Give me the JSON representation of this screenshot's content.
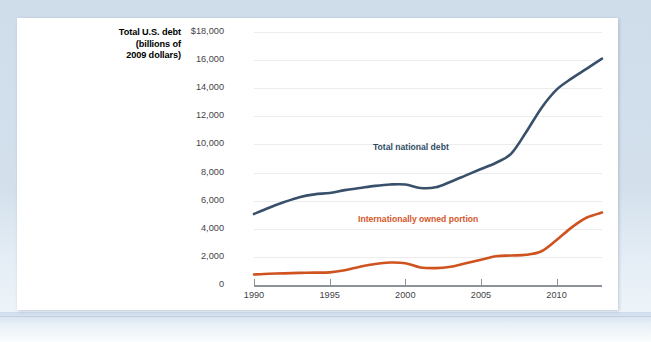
{
  "figure": {
    "axis_title_lines": [
      "Total U.S. debt",
      "(billions of",
      "2009 dollars)"
    ],
    "colors": {
      "total_debt_line": "#39506a",
      "internationally_owned_line": "#cf531f",
      "gridline": "#ececef",
      "axis": "#8d9299",
      "card_background": "#ffffff",
      "page_background": "#d3e0ec"
    }
  },
  "chart_data": {
    "type": "line",
    "title": "",
    "xlabel": "",
    "ylabel": "Total U.S. debt (billions of 2009 dollars)",
    "xlim": [
      1990,
      2013
    ],
    "ylim": [
      0,
      18000
    ],
    "grid": true,
    "legend_position": "inline-annotations",
    "x_tick_labels": [
      "1990",
      "1995",
      "2000",
      "2005",
      "2010"
    ],
    "x_ticks": [
      1990,
      1995,
      2000,
      2005,
      2010
    ],
    "y_tick_labels": [
      "$18,000",
      "16,000",
      "14,000",
      "12,000",
      "10,000",
      "8,000",
      "6,000",
      "4,000",
      "2,000",
      "0"
    ],
    "y_ticks": [
      18000,
      16000,
      14000,
      12000,
      10000,
      8000,
      6000,
      4000,
      2000,
      0
    ],
    "x": [
      1990,
      1991,
      1992,
      1993,
      1994,
      1995,
      1996,
      1997,
      1998,
      1999,
      2000,
      2001,
      2002,
      2003,
      2004,
      2005,
      2006,
      2007,
      2008,
      2009,
      2010,
      2011,
      2012,
      2013
    ],
    "series": [
      {
        "name": "Total national debt",
        "color": "#39506a",
        "values": [
          5050,
          5500,
          5900,
          6250,
          6450,
          6550,
          6750,
          6900,
          7050,
          7150,
          7150,
          6900,
          6950,
          7350,
          7800,
          8250,
          8700,
          9350,
          10900,
          12600,
          13900,
          14700,
          15400,
          16100
        ]
      },
      {
        "name": "Internationally owned portion",
        "color": "#cf531f",
        "values": [
          750,
          800,
          830,
          860,
          880,
          900,
          1050,
          1300,
          1500,
          1600,
          1550,
          1250,
          1200,
          1300,
          1550,
          1800,
          2050,
          2100,
          2150,
          2400,
          3200,
          4100,
          4800,
          5150
        ]
      }
    ],
    "annotations": [
      {
        "text": "Total national debt",
        "series": "Total national debt",
        "color": "#2f4a63"
      },
      {
        "text": "Internationally owned portion",
        "series": "Internationally owned portion",
        "color": "#d4562a"
      }
    ]
  }
}
